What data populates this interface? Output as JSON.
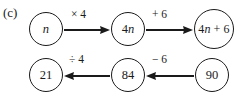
{
  "figure": {
    "part_label": "(c)",
    "caption": "",
    "type": "function-machine-flow-diagram"
  },
  "rows": [
    {
      "name": "forward-row",
      "direction": "left-to-right",
      "nodes": [
        {
          "id": "node-n",
          "label": "n",
          "style": "italic",
          "cx": 46,
          "cy": 29,
          "r": 17
        },
        {
          "id": "node-4n",
          "label": "4n",
          "style": "mixed",
          "cx": 128,
          "cy": 29,
          "r": 17
        },
        {
          "id": "node-4n6",
          "label": "4n + 6",
          "style": "mixed",
          "cx": 214,
          "cy": 29,
          "r": 20
        }
      ],
      "arrows": [
        {
          "id": "arrow-times-4",
          "label": "× 4",
          "from": "node-n",
          "to": "node-4n",
          "x1": 64,
          "x2": 110,
          "y": 30,
          "label_x": 71,
          "label_y": 9
        },
        {
          "id": "arrow-plus-6",
          "label": "+ 6",
          "from": "node-4n",
          "to": "node-4n6",
          "x1": 146,
          "x2": 193,
          "y": 30,
          "label_x": 152,
          "label_y": 9
        }
      ]
    },
    {
      "name": "reverse-row",
      "direction": "right-to-left",
      "nodes": [
        {
          "id": "node-21",
          "label": "21",
          "style": "normal",
          "cx": 46,
          "cy": 75,
          "r": 17
        },
        {
          "id": "node-84",
          "label": "84",
          "style": "normal",
          "cx": 128,
          "cy": 75,
          "r": 17
        },
        {
          "id": "node-90",
          "label": "90",
          "style": "normal",
          "cx": 212,
          "cy": 75,
          "r": 17
        }
      ],
      "arrows": [
        {
          "id": "arrow-divide-4",
          "label": "÷ 4",
          "from": "node-84",
          "to": "node-21",
          "x1": 110,
          "x2": 64,
          "y": 76,
          "label_x": 69,
          "label_y": 54
        },
        {
          "id": "arrow-minus-6",
          "label": "− 6",
          "from": "node-90",
          "to": "node-84",
          "x1": 194,
          "x2": 146,
          "y": 76,
          "label_x": 152,
          "label_y": 54
        }
      ]
    }
  ],
  "colors": {
    "ink": "#1a1a1a",
    "paper": "#ffffff"
  }
}
